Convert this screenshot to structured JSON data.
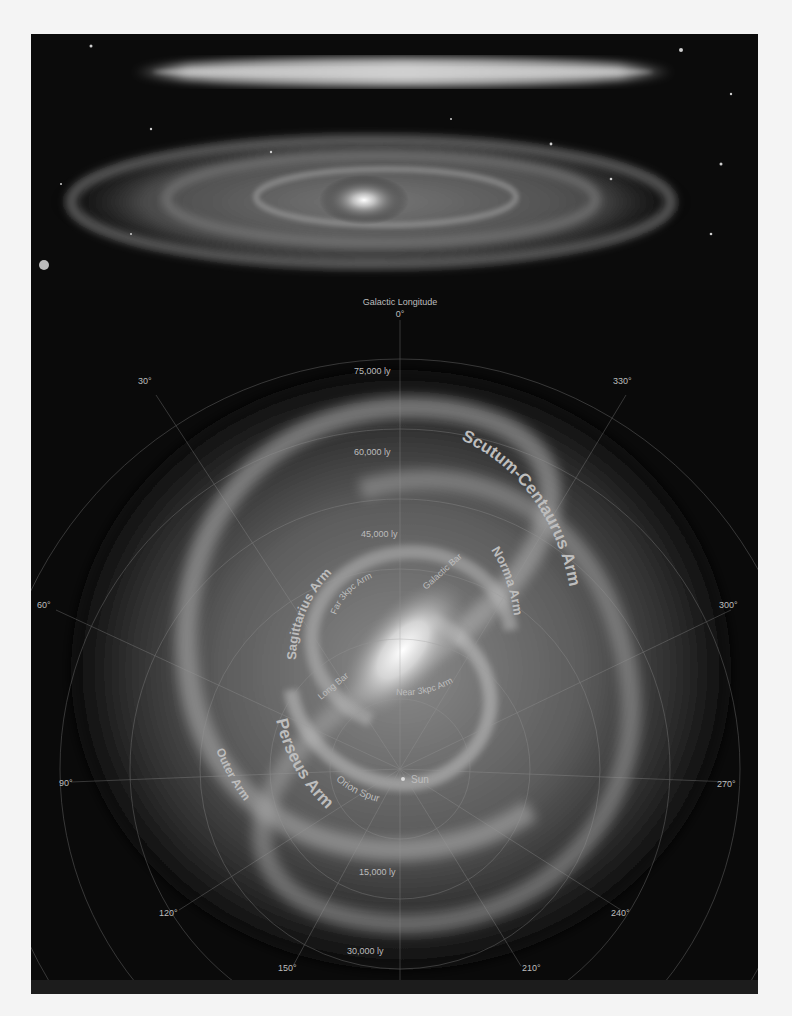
{
  "top_panel": {
    "subject": "edge-on and tilted spiral galaxy photographs"
  },
  "map": {
    "title": "Galactic Longitude",
    "longitude_labels": [
      {
        "label": "0°",
        "x": 369,
        "y": 27
      },
      {
        "label": "30°",
        "x": 107,
        "y": 94
      },
      {
        "label": "330°",
        "x": 582,
        "y": 94
      },
      {
        "label": "60°",
        "x": 12,
        "y": 314
      },
      {
        "label": "300°",
        "x": 684,
        "y": 314
      },
      {
        "label": "90°",
        "x": 30,
        "y": 492
      },
      {
        "label": "270°",
        "x": 688,
        "y": 494
      },
      {
        "label": "120°",
        "x": 128,
        "y": 624
      },
      {
        "label": "240°",
        "x": 582,
        "y": 624
      },
      {
        "label": "150°",
        "x": 249,
        "y": 680
      },
      {
        "label": "210°",
        "x": 493,
        "y": 680
      },
      {
        "label": "180°",
        "x": 361,
        "y": 700
      }
    ],
    "distance_labels": [
      {
        "label": "75,000 ly",
        "x": 324,
        "y": 82
      },
      {
        "label": "60,000 ly",
        "x": 325,
        "y": 163
      },
      {
        "label": "45,000 ly",
        "x": 330,
        "y": 246
      },
      {
        "label": "15,000 ly",
        "x": 328,
        "y": 584
      },
      {
        "label": "30,000 ly",
        "x": 316,
        "y": 663
      }
    ],
    "arms": [
      {
        "name": "Scutum-Centaurus Arm",
        "size": 17
      },
      {
        "name": "Norma Arm",
        "size": 13
      },
      {
        "name": "Sagittarius Arm",
        "size": 13
      },
      {
        "name": "Far 3kpc Arm",
        "size": 9
      },
      {
        "name": "Galactic Bar",
        "size": 9
      },
      {
        "name": "Near 3kpc Arm",
        "size": 9
      },
      {
        "name": "Long Bar",
        "size": 9
      },
      {
        "name": "Perseus Arm",
        "size": 17
      },
      {
        "name": "Outer Arm",
        "size": 12
      },
      {
        "name": "Orion Spur",
        "size": 10
      },
      {
        "name": "Sun",
        "size": 10
      }
    ]
  }
}
